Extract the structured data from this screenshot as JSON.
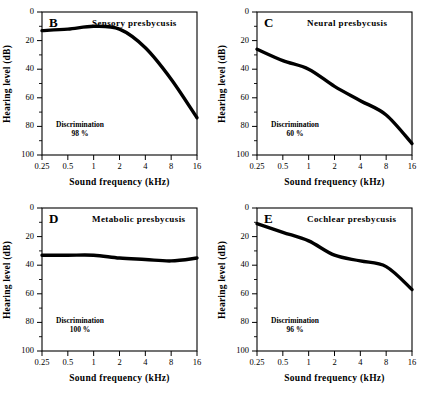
{
  "figure": {
    "axis": {
      "xlabel": "Sound frequency  (kHz)",
      "ylabel": "Hearing level  (dB)",
      "xticks": [
        "0.25",
        "0.5",
        "1",
        "2",
        "4",
        "8",
        "16"
      ],
      "yticks": [
        "0",
        "20",
        "40",
        "60",
        "80",
        "100"
      ]
    },
    "discrimination_label": "Discrimination"
  },
  "chart_data": [
    {
      "type": "line",
      "panel": "B",
      "title": "Sensory  presbycusis",
      "xlabel": "Sound frequency  (kHz)",
      "ylabel": "Hearing level  (dB)",
      "x": [
        0.25,
        0.5,
        1,
        2,
        4,
        8,
        16
      ],
      "values": [
        13,
        12,
        10,
        12,
        25,
        47,
        74
      ],
      "xscale": "log",
      "xlim": [
        0.25,
        16
      ],
      "ylim": [
        0,
        100
      ],
      "y_inverted": true,
      "grid": false,
      "legend": "none",
      "annotations": {
        "discrimination": "98 %"
      }
    },
    {
      "type": "line",
      "panel": "C",
      "title": "Neural  presbycusis",
      "xlabel": "Sound frequency  (kHz)",
      "ylabel": "Hearing level  (dB)",
      "x": [
        0.25,
        0.5,
        1,
        2,
        4,
        8,
        16
      ],
      "values": [
        26,
        34,
        40,
        52,
        62,
        72,
        92
      ],
      "xscale": "log",
      "xlim": [
        0.25,
        16
      ],
      "ylim": [
        0,
        100
      ],
      "y_inverted": true,
      "grid": false,
      "legend": "none",
      "annotations": {
        "discrimination": "60 %"
      }
    },
    {
      "type": "line",
      "panel": "D",
      "title": "Metabolic  presbycusis",
      "xlabel": "Sound frequency  (kHz)",
      "ylabel": "Hearing level  (dB)",
      "x": [
        0.25,
        0.5,
        1,
        2,
        4,
        8,
        16
      ],
      "values": [
        33,
        33,
        33,
        35,
        36,
        37,
        35
      ],
      "xscale": "log",
      "xlim": [
        0.25,
        16
      ],
      "ylim": [
        0,
        100
      ],
      "y_inverted": true,
      "grid": false,
      "legend": "none",
      "annotations": {
        "discrimination": "100 %"
      }
    },
    {
      "type": "line",
      "panel": "E",
      "title": "Cochlear  presbycusis",
      "xlabel": "Sound frequency  (kHz)",
      "ylabel": "Hearing level  (dB)",
      "x": [
        0.25,
        0.5,
        1,
        2,
        4,
        8,
        16
      ],
      "values": [
        11,
        17,
        23,
        33,
        37,
        41,
        57
      ],
      "xscale": "log",
      "xlim": [
        0.25,
        16
      ],
      "ylim": [
        0,
        100
      ],
      "y_inverted": true,
      "grid": false,
      "legend": "none",
      "annotations": {
        "discrimination": "96 %"
      }
    }
  ]
}
